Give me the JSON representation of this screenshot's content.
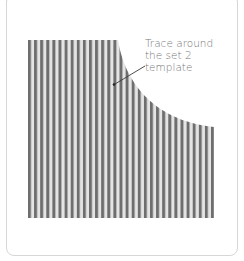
{
  "figure": {
    "annotation": {
      "lines": [
        "Trace around",
        "the set 2",
        "template"
      ]
    },
    "pattern": {
      "type": "vertical-stripes",
      "stripe_color": "#6e6e6e",
      "background_color": "#ffffff",
      "stripe_count": 30,
      "shape": "rectangle-with-concave-curved-top-right-corner"
    },
    "border_color": "#d6d6d6"
  }
}
